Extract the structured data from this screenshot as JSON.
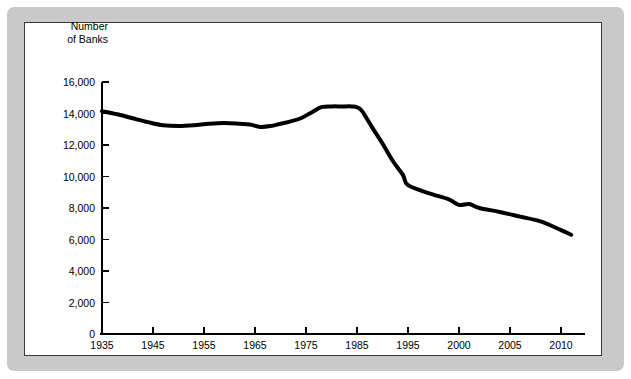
{
  "figure": {
    "frame_color": "#c9c9c9",
    "panel_background": "#ffffff",
    "panel_border_color": "#3a3a3a",
    "line_color": "#000000",
    "axis_color": "#000000"
  },
  "axis_title": "Number\nof Banks",
  "chart_data": {
    "type": "line",
    "title": "",
    "subtitle": "",
    "xlabel": "",
    "ylabel": "Number of Banks",
    "ylim": [
      0,
      16000
    ],
    "ytick_labels": [
      "0",
      "2,000",
      "4,000",
      "6,000",
      "8,000",
      "10,000",
      "12,000",
      "14,000",
      "16,000"
    ],
    "ytick_values": [
      0,
      2000,
      4000,
      6000,
      8000,
      10000,
      12000,
      14000,
      16000
    ],
    "xtick_labels": [
      "1935",
      "1945",
      "1955",
      "1965",
      "1975",
      "1985",
      "1995",
      "2000",
      "2005",
      "2010"
    ],
    "xtick_values": [
      1935,
      1945,
      1955,
      1965,
      1975,
      1985,
      1995,
      2000,
      2005,
      2010
    ],
    "x_axis_note": "category-spaced: equal pixel spacing between listed ticks (10-year steps through 1995, then 5-year steps)",
    "grid": false,
    "legend": "none",
    "series": [
      {
        "name": "Number of Banks",
        "x": [
          1935,
          1938,
          1941,
          1944,
          1947,
          1950,
          1953,
          1956,
          1959,
          1962,
          1964,
          1966,
          1968,
          1970,
          1972,
          1974,
          1976,
          1978,
          1980,
          1982,
          1984,
          1985,
          1986,
          1988,
          1990,
          1992,
          1994,
          1995,
          1997,
          1999,
          2000,
          2001,
          2002,
          2004,
          2006,
          2008,
          2010,
          2011
        ],
        "values": [
          14150,
          13950,
          13700,
          13450,
          13250,
          13200,
          13250,
          13350,
          13400,
          13350,
          13300,
          13150,
          13200,
          13350,
          13500,
          13700,
          14050,
          14400,
          14450,
          14450,
          14450,
          14400,
          14150,
          13100,
          12100,
          11000,
          10100,
          9450,
          8950,
          8550,
          8200,
          8250,
          8000,
          7750,
          7450,
          7150,
          6600,
          6300
        ],
        "line_width_px": 4,
        "color": "#000000",
        "marker": "none"
      }
    ],
    "annotations": []
  }
}
